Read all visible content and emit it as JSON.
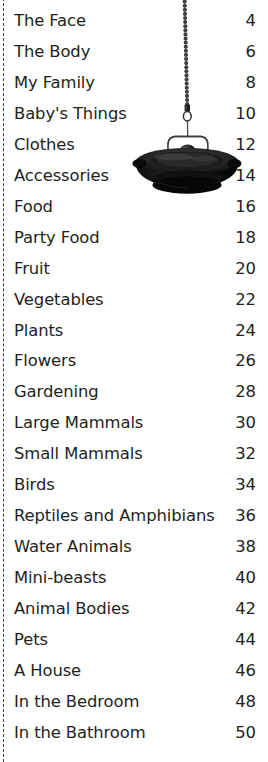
{
  "page": {
    "kind": "book-table-of-contents",
    "background_color": "#ffffff",
    "text_color": "#231f20",
    "rule_color": "#3a3a3a"
  },
  "left_rule": {
    "name": "dashed-vertical-rule",
    "style": "dashed"
  },
  "contents": {
    "rows": [
      {
        "title": "The Face",
        "page": "4"
      },
      {
        "title": "The Body",
        "page": "6"
      },
      {
        "title": "My Family",
        "page": "8"
      },
      {
        "title": "Baby's Things",
        "page": "10"
      },
      {
        "title": "Clothes",
        "page": "12"
      },
      {
        "title": "Accessories",
        "page": "14"
      },
      {
        "title": "Food",
        "page": "16"
      },
      {
        "title": "Party Food",
        "page": "18"
      },
      {
        "title": "Fruit",
        "page": "20"
      },
      {
        "title": "Vegetables",
        "page": "22"
      },
      {
        "title": "Plants",
        "page": "24"
      },
      {
        "title": "Flowers",
        "page": "26"
      },
      {
        "title": "Gardening",
        "page": "28"
      },
      {
        "title": "Large Mammals",
        "page": "30"
      },
      {
        "title": "Small Mammals",
        "page": "32"
      },
      {
        "title": "Birds",
        "page": "34"
      },
      {
        "title": "Reptiles and Amphibians",
        "page": "36"
      },
      {
        "title": "Water Animals",
        "page": "38"
      },
      {
        "title": "Mini-beasts",
        "page": "40"
      },
      {
        "title": "Animal Bodies",
        "page": "42"
      },
      {
        "title": "Pets",
        "page": "44"
      },
      {
        "title": "A House",
        "page": "46"
      },
      {
        "title": "In the Bedroom",
        "page": "48"
      },
      {
        "title": "In the Bathroom",
        "page": "50"
      }
    ]
  },
  "illustration": {
    "name": "hanging-pendant-lamp",
    "description": "black pendant lamp hanging from a beaded ball chain",
    "shade_color": "#141414",
    "chain_color": "#3d3d3d"
  }
}
